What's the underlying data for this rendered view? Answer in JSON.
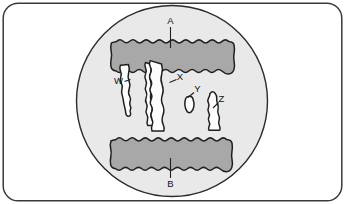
{
  "figure": {
    "frame": {
      "shape": "rounded-rectangle",
      "border_color": "#3a3a3a",
      "fill_color": "#ffffff"
    },
    "circle_inset": {
      "shape": "circle",
      "fill_color": "#e9e9e9",
      "stroke_color": "#2b2b2b",
      "center_x": 172,
      "center_y": 101,
      "radius": 96
    },
    "formations": {
      "upper_band": {
        "label": "A",
        "name": "upper rock layer",
        "fill_color": "#a8a8a8",
        "stroke_color": "#1f1f1f",
        "edge_style": "scalloped"
      },
      "lower_band": {
        "label": "B",
        "name": "lower rock layer",
        "fill_color": "#a8a8a8",
        "stroke_color": "#1f1f1f",
        "edge_style": "scalloped"
      },
      "columns": {
        "fill_color": "#fcfcfc",
        "stroke_color": "#1f1f1f"
      }
    },
    "labels": [
      {
        "id": "A",
        "text": "A",
        "x": 170,
        "y": 22,
        "leader": "down",
        "target": "upper-band"
      },
      {
        "id": "W",
        "text": "W",
        "x": 119,
        "y": 81,
        "leader": "right",
        "target": "column-w"
      },
      {
        "id": "X",
        "text": "X",
        "x": 178,
        "y": 79,
        "leader": "left",
        "target": "column-x"
      },
      {
        "id": "Y",
        "text": "Y",
        "x": 196,
        "y": 93,
        "leader": "left",
        "target": "oval-y"
      },
      {
        "id": "Z",
        "text": "Z",
        "x": 220,
        "y": 103,
        "leader": "left",
        "target": "column-z"
      },
      {
        "id": "B",
        "text": "B",
        "x": 170,
        "y": 183,
        "leader": "up",
        "target": "lower-band"
      }
    ],
    "colors": {
      "background": "#ffffff",
      "frame_stroke": "#3a3a3a",
      "circle_fill": "#e9e9e9",
      "circle_stroke": "#2b2b2b",
      "band_fill": "#a8a8a8",
      "band_stroke": "#1f1f1f",
      "column_fill": "#fcfcfc",
      "column_stroke": "#1f1f1f",
      "label_text": "#111111"
    }
  }
}
